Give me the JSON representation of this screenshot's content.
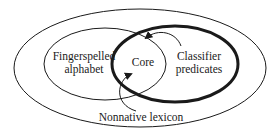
{
  "diagram": {
    "regions": {
      "outer": {
        "label": ""
      },
      "fingerspelled": {
        "line1": "Fingerspelled",
        "line2": "alphabet"
      },
      "classifier": {
        "line1": "Classifier",
        "line2": "predicates"
      },
      "core": {
        "label": "Core"
      },
      "nonnative": {
        "label": "Nonnative lexicon"
      }
    },
    "arrows": [
      {
        "from": "Classifier predicates",
        "to": "Core"
      },
      {
        "from": "Nonnative lexicon",
        "to": "Core"
      }
    ],
    "colors": {
      "stroke": "#1a1a1a",
      "background": "#ffffff"
    }
  }
}
